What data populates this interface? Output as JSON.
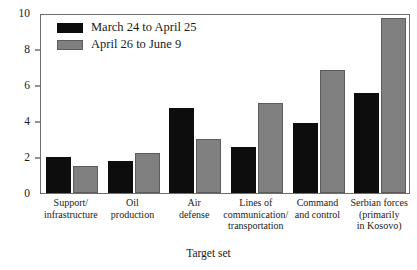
{
  "chart_data": {
    "type": "bar",
    "title": "",
    "xlabel": "Target set",
    "ylabel": "",
    "ylim": [
      0,
      10
    ],
    "yticks": [
      0,
      2,
      4,
      6,
      8,
      10
    ],
    "grid": false,
    "legend_position": "top-left",
    "categories": [
      "Support/ infrastructure",
      "Oil production",
      "Air defense",
      "Lines of communication/ transportation",
      "Command and control",
      "Serbian forces (primarily in Kosovo)"
    ],
    "category_lines": [
      [
        "Support/",
        "infrastructure"
      ],
      [
        "Oil",
        "production"
      ],
      [
        "Air",
        "defense"
      ],
      [
        "Lines of",
        "communication/",
        "transportation"
      ],
      [
        "Command",
        "and control"
      ],
      [
        "Serbian forces",
        "(primarily",
        "in Kosovo)"
      ]
    ],
    "series": [
      {
        "name": "March 24 to April 25",
        "color": "#0d0d0d",
        "values": [
          2.0,
          1.8,
          4.75,
          2.55,
          3.9,
          5.55
        ]
      },
      {
        "name": "April 26 to June 9",
        "color": "#808080",
        "values": [
          1.5,
          2.25,
          3.0,
          5.0,
          6.85,
          9.7
        ]
      }
    ]
  },
  "axis": {
    "y_tick_labels": [
      "10",
      "8",
      "6",
      "4",
      "2",
      "0"
    ],
    "x_title": "Target set"
  },
  "legend": {
    "items": [
      {
        "label": "March 24 to April 25",
        "swatch": "black-swatch"
      },
      {
        "label": "April 26 to June 9",
        "swatch": "gray-swatch"
      }
    ]
  },
  "colors": {
    "series_1": "#0d0d0d",
    "series_2": "#808080",
    "frame": "#6e6e6e",
    "background": "#ffffff"
  }
}
